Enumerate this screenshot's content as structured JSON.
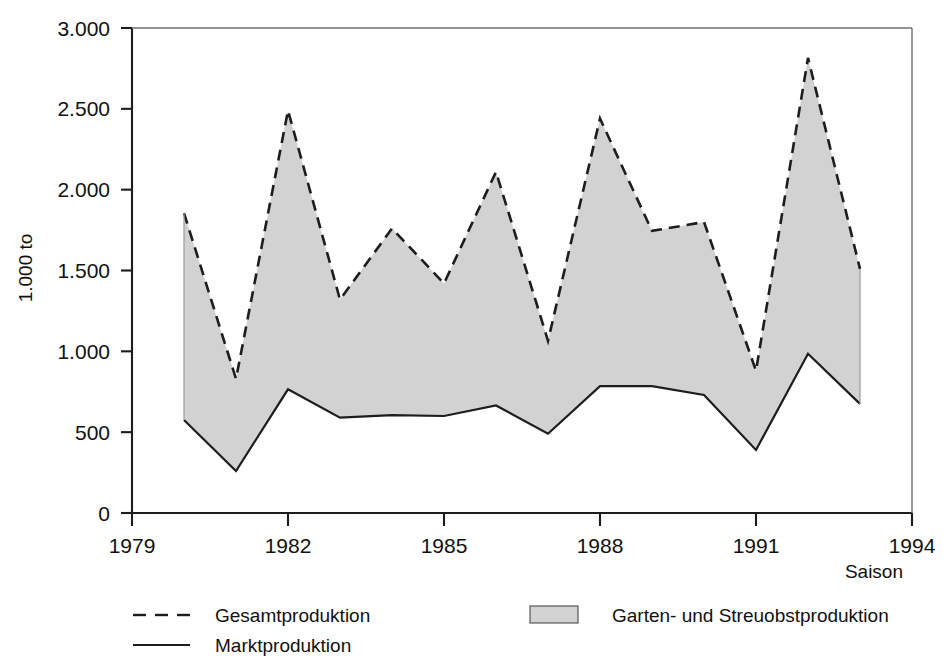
{
  "chart_data": {
    "type": "area",
    "title": "",
    "subtitle": "",
    "xlabel": "Saison",
    "ylabel": "1.000 to",
    "x": [
      1980,
      1981,
      1982,
      1983,
      1984,
      1985,
      1986,
      1987,
      1988,
      1989,
      1990,
      1991,
      1992,
      1993
    ],
    "xlim": [
      1979,
      1994
    ],
    "ylim": [
      0,
      3000
    ],
    "xtick_labels": [
      "1979",
      "1982",
      "1985",
      "1988",
      "1991",
      "1994"
    ],
    "xtick_values": [
      1979,
      1982,
      1985,
      1988,
      1991,
      1994
    ],
    "ytick_labels": [
      "0",
      "500",
      "1.000",
      "1.500",
      "2.000",
      "2.500",
      "3.000"
    ],
    "ytick_values": [
      0,
      500,
      1000,
      1500,
      2000,
      2500,
      3000
    ],
    "grid": false,
    "legend_position": "below-plot",
    "series": [
      {
        "name": "Gesamtproduktion",
        "style": "dashed",
        "color": "#1d1d1d",
        "values": [
          1855,
          830,
          2490,
          1320,
          1760,
          1420,
          2110,
          1065,
          2440,
          1745,
          1800,
          880,
          2815,
          1510
        ]
      },
      {
        "name": "Marktproduktion",
        "style": "solid",
        "color": "#1d1d1d",
        "values": [
          575,
          260,
          765,
          590,
          605,
          600,
          665,
          490,
          785,
          785,
          730,
          390,
          985,
          675
        ]
      },
      {
        "name": "Garten- und Streuobstproduktion",
        "style": "filled-band",
        "color": "#d2d2d2",
        "description": "Flaeche zwischen Gesamtproduktion und Marktproduktion",
        "values": [
          1280,
          570,
          1725,
          730,
          1155,
          820,
          1445,
          575,
          1655,
          960,
          1070,
          490,
          1830,
          835
        ]
      }
    ],
    "annotations": []
  },
  "legend": {
    "entries": [
      {
        "label": "Gesamtproduktion",
        "swatch": "dashed-line"
      },
      {
        "label": "Marktproduktion",
        "swatch": "solid-line"
      },
      {
        "label": "Garten- und Streuobstproduktion",
        "swatch": "gray-box"
      }
    ]
  },
  "colors": {
    "band_fill": "#d2d2d2",
    "line": "#1d1d1d",
    "axis": "#1d1d1d",
    "background": "#ffffff"
  }
}
